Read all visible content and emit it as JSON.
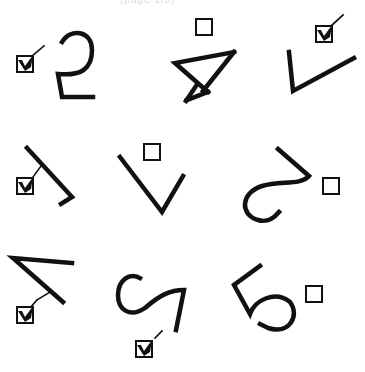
{
  "header": {
    "fragment": "(page 1/3)"
  },
  "grid": {
    "items": [
      {
        "id": "item-1",
        "glyph": "digit-2-mirrored",
        "checked": true
      },
      {
        "id": "item-2",
        "glyph": "digit-4-rotated",
        "checked": false
      },
      {
        "id": "item-3",
        "glyph": "digit-1-rotated",
        "checked": true
      },
      {
        "id": "item-4",
        "glyph": "digit-1-flipped",
        "checked": true
      },
      {
        "id": "item-5",
        "glyph": "letter-v",
        "checked": false
      },
      {
        "id": "item-6",
        "glyph": "digit-2-rotated",
        "checked": false
      },
      {
        "id": "item-7",
        "glyph": "digit-4-flipped",
        "checked": true
      },
      {
        "id": "item-8",
        "glyph": "digit-2-rotated-s",
        "checked": true
      },
      {
        "id": "item-9",
        "glyph": "digit-5-rotated",
        "checked": false
      }
    ]
  },
  "colors": {
    "ink": "#111111",
    "background": "#ffffff"
  }
}
